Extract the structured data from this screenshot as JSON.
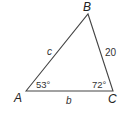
{
  "diagram": {
    "type": "triangle",
    "line_color": "#444444",
    "vertices": {
      "A": {
        "label": "A",
        "x": 26,
        "y": 91
      },
      "B": {
        "label": "B",
        "x": 88,
        "y": 14
      },
      "C": {
        "label": "C",
        "x": 113,
        "y": 91
      }
    },
    "sides": {
      "c": {
        "label": "c",
        "between": [
          "A",
          "B"
        ]
      },
      "a": {
        "label": "20",
        "between": [
          "B",
          "C"
        ]
      },
      "b": {
        "label": "b",
        "between": [
          "A",
          "C"
        ]
      }
    },
    "angles": {
      "A": {
        "label": "53°"
      },
      "C": {
        "label": "72°"
      }
    }
  }
}
